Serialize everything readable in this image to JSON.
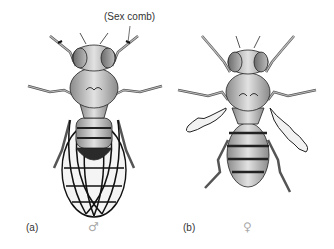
{
  "figure": {
    "annotation": "(Sex comb)",
    "panels": [
      {
        "label": "(a)",
        "sex_symbol": "♂",
        "sex": "male",
        "description": "Drosophila male, dorsal view, wings spread showing venation, darkened abdomen tip"
      },
      {
        "label": "(b)",
        "sex_symbol": "♀",
        "sex": "female",
        "description": "Drosophila female, dorsal view, vestigial crumpled wings, striped abdomen"
      }
    ],
    "colors": {
      "background": "#ffffff",
      "body_fill": "#bdbdbd",
      "outline": "#222222",
      "stripe": "#333333",
      "label_text": "#333333",
      "symbol_text": "#aaaaaa"
    }
  }
}
